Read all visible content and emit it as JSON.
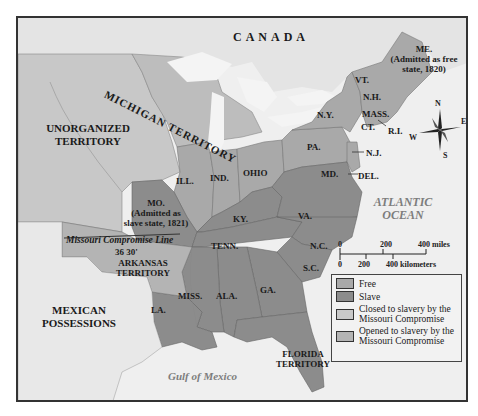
{
  "map": {
    "regions": {
      "canada": "CANADA",
      "unorganized": "UNORGANIZED TERRITORY",
      "michigan": "MICHIGAN TERRITORY",
      "mexican": "MEXICAN POSSESSIONS",
      "arkansas": "ARKANSAS TERRITORY",
      "florida": "FLORIDA TERRITORY"
    },
    "states": {
      "me": "ME.",
      "me_note": "(Admitted as free state, 1820)",
      "vt": "VT.",
      "nh": "N.H.",
      "mass": "MASS.",
      "ct": "CT.",
      "ri": "R.I.",
      "ny": "N.Y.",
      "pa": "PA.",
      "nj": "N.J.",
      "md": "MD.",
      "del": "DEL.",
      "ohio": "OHIO",
      "ind": "IND.",
      "ill": "ILL.",
      "mo": "MO.",
      "mo_note": "(Admitted as slave state, 1821)",
      "ky": "KY.",
      "va": "VA.",
      "nc": "N.C.",
      "tenn": "TENN.",
      "sc": "S.C.",
      "ga": "GA.",
      "ala": "ALA.",
      "miss": "MISS.",
      "la": "LA."
    },
    "water": {
      "atlantic": "ATLANTIC OCEAN",
      "gulf": "Gulf of Mexico"
    },
    "line": {
      "label": "Missouri Compromise Line",
      "latitude": "36 30'"
    },
    "compass": {
      "n": "N",
      "e": "E",
      "s": "S",
      "w": "W"
    },
    "scale": {
      "miles_labels": [
        "0",
        "200",
        "400 miles"
      ],
      "km_labels": [
        "0",
        "200",
        "400 kilometers"
      ]
    },
    "colors": {
      "free": "#a9a9a9",
      "slave": "#8c8c8c",
      "closed": "#c8c8c8",
      "opened": "#b4b4b4",
      "background": "#ececec"
    }
  },
  "legend": {
    "items": [
      {
        "label": "Free",
        "color": "#a9a9a9"
      },
      {
        "label": "Slave",
        "color": "#8c8c8c"
      },
      {
        "label": "Closed to slavery by the Missouri Compromise",
        "color": "#c8c8c8"
      },
      {
        "label": "Opened to slavery by the Missouri Compromise",
        "color": "#b4b4b4"
      }
    ]
  }
}
